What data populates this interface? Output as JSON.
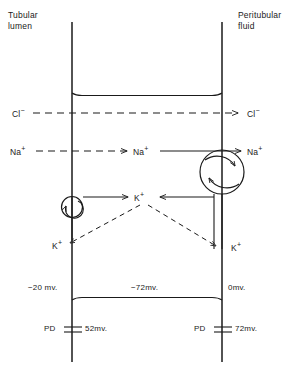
{
  "figure": {
    "compartments": {
      "left_label_line1": "Tubular",
      "left_label_line2": "lumen",
      "right_label_line1": "Peritubular",
      "right_label_line2": "fluid"
    },
    "ions": {
      "chloride": "Cl",
      "chloride_charge": "−",
      "sodium": "Na",
      "sodium_charge": "+",
      "potassium": "K",
      "potassium_charge": "+"
    },
    "labels": {
      "cl_left": "Cl",
      "cl_right": "Cl",
      "na_left": "Na",
      "na_mid": "Na",
      "na_right": "Na",
      "k_mid": "K",
      "k_lower_left": "K",
      "k_lower_right": "K"
    },
    "potentials": {
      "lumen": "−20 mv.",
      "cell": "−72mv.",
      "peritubular": "0mv.",
      "pd_left_prefix": "PD",
      "pd_left_value": "52mv.",
      "pd_right_prefix": "PD",
      "pd_right_value": "72mv."
    },
    "pumps": {
      "large_pump_name": "sodium-potassium-pump",
      "small_pump_name": "potassium-pump"
    },
    "colors": {
      "ink": "#1a1a1a",
      "background": "#ffffff"
    }
  }
}
